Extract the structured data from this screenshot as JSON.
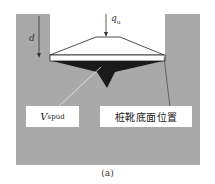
{
  "figure": {
    "caption": "(a)",
    "load_label": {
      "symbol": "q",
      "subscript": "u"
    },
    "depth_label": "d",
    "volume_label": {
      "symbol": "V",
      "subscript": "spud"
    },
    "position_label": "桩靴底面位置",
    "colors": {
      "soil": "#a9a9a9",
      "spudcan_fill": "#ffffff",
      "spudcan_cone": "#1a1a1a",
      "outline": "#222222",
      "background": "#ffffff"
    }
  }
}
